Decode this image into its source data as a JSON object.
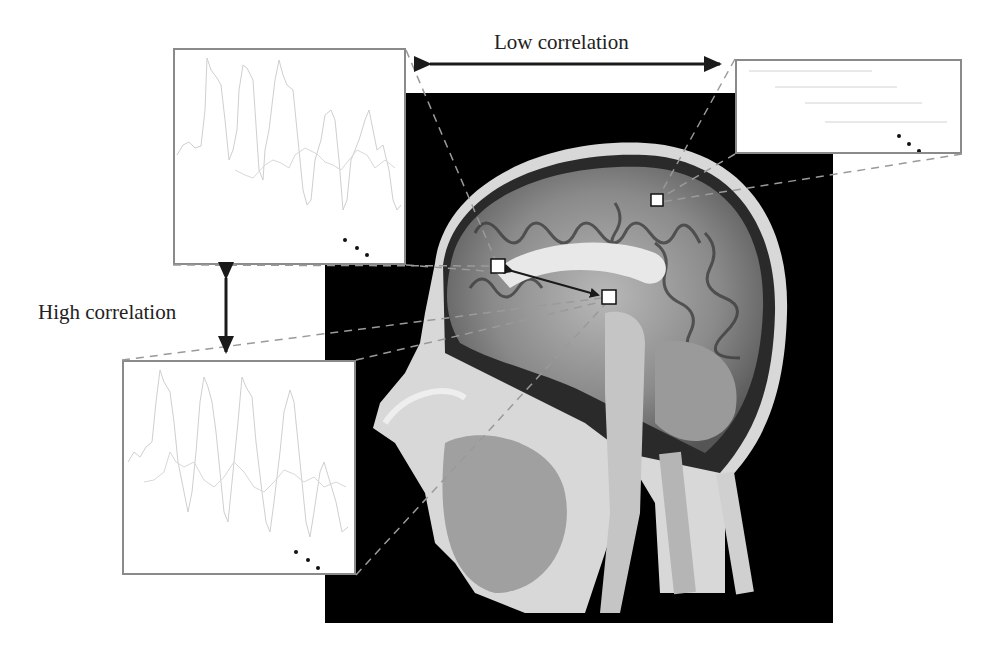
{
  "figure": {
    "labels": {
      "low_correlation": "Low correlation",
      "high_correlation": "High correlation"
    },
    "image": {
      "description": "Sagittal T1-weighted MRI of human head",
      "roi_markers": [
        {
          "id": "roi-frontal",
          "x": 498,
          "y": 266
        },
        {
          "id": "roi-thalamic",
          "x": 609,
          "y": 297
        },
        {
          "id": "roi-parietal",
          "x": 657,
          "y": 200
        }
      ]
    },
    "signal_boxes": [
      {
        "id": "box-top-left",
        "x": 173,
        "y": 48,
        "w": 233,
        "h": 217,
        "content": "oscillating time series",
        "ellipsis": "..."
      },
      {
        "id": "box-top-right",
        "x": 735,
        "y": 59,
        "w": 227,
        "h": 95,
        "content": "flat time series",
        "ellipsis": "..."
      },
      {
        "id": "box-bottom-left",
        "x": 122,
        "y": 360,
        "w": 234,
        "h": 215,
        "content": "oscillating time series",
        "ellipsis": "..."
      }
    ],
    "colors": {
      "background": "#ffffff",
      "mri_background": "#000000",
      "box_border": "#8a8a8a",
      "signal_line": "#c8c8c8",
      "arrow": "#1a1a1a",
      "dashed_line": "#9a9a9a"
    }
  }
}
